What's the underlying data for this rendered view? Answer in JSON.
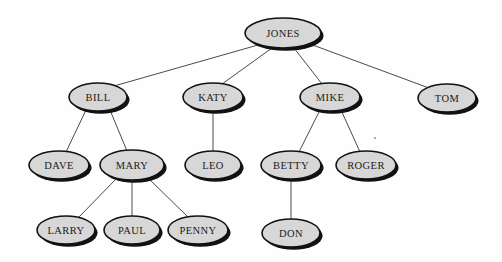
{
  "diagram": {
    "type": "tree",
    "background_color": "#fefefe",
    "node_fill_color": "#d7d7d7",
    "node_stroke_color": "#111111",
    "node_shadow_color": "#121212",
    "edge_color": "#4a4a4a",
    "label_color": "#1a1a1a",
    "root": "JONES",
    "nodes": [
      {
        "id": "JONES",
        "label": "JONES",
        "cx": 283,
        "cy": 33,
        "rx": 38,
        "ry": 15,
        "level": 0
      },
      {
        "id": "BILL",
        "label": "BILL",
        "cx": 98,
        "cy": 97,
        "rx": 29,
        "ry": 14,
        "level": 1
      },
      {
        "id": "KATY",
        "label": "KATY",
        "cx": 213,
        "cy": 97,
        "rx": 30,
        "ry": 14,
        "level": 1
      },
      {
        "id": "MIKE",
        "label": "MIKE",
        "cx": 330,
        "cy": 97,
        "rx": 30,
        "ry": 14,
        "level": 1
      },
      {
        "id": "TOM",
        "label": "TOM",
        "cx": 447,
        "cy": 98,
        "rx": 29,
        "ry": 14,
        "level": 1
      },
      {
        "id": "DAVE",
        "label": "DAVE",
        "cx": 59,
        "cy": 165,
        "rx": 30,
        "ry": 14,
        "level": 2
      },
      {
        "id": "MARY",
        "label": "MARY",
        "cx": 132,
        "cy": 165,
        "rx": 32,
        "ry": 15,
        "level": 2
      },
      {
        "id": "LEO",
        "label": "LEO",
        "cx": 213,
        "cy": 165,
        "rx": 28,
        "ry": 14,
        "level": 2
      },
      {
        "id": "BETTY",
        "label": "BETTY",
        "cx": 291,
        "cy": 165,
        "rx": 30,
        "ry": 14,
        "level": 2
      },
      {
        "id": "ROGER",
        "label": "ROGER",
        "cx": 366,
        "cy": 165,
        "rx": 30,
        "ry": 14,
        "level": 2
      },
      {
        "id": "LARRY",
        "label": "LARRY",
        "cx": 66,
        "cy": 230,
        "rx": 29,
        "ry": 14,
        "level": 3
      },
      {
        "id": "PAUL",
        "label": "PAUL",
        "cx": 132,
        "cy": 230,
        "rx": 28,
        "ry": 14,
        "level": 3
      },
      {
        "id": "PENNY",
        "label": "PENNY",
        "cx": 198,
        "cy": 230,
        "rx": 30,
        "ry": 14,
        "level": 3
      },
      {
        "id": "DON",
        "label": "DON",
        "cx": 291,
        "cy": 233,
        "rx": 29,
        "ry": 14,
        "level": 3
      }
    ],
    "edges": [
      {
        "from": "JONES",
        "to": "BILL",
        "x1": 258,
        "y1": 45,
        "x2": 114,
        "y2": 86
      },
      {
        "from": "JONES",
        "to": "KATY",
        "x1": 272,
        "y1": 48,
        "x2": 222,
        "y2": 84
      },
      {
        "from": "JONES",
        "to": "MIKE",
        "x1": 294,
        "y1": 48,
        "x2": 322,
        "y2": 84
      },
      {
        "from": "JONES",
        "to": "TOM",
        "x1": 310,
        "y1": 44,
        "x2": 429,
        "y2": 88
      },
      {
        "from": "BILL",
        "to": "DAVE",
        "x1": 86,
        "y1": 110,
        "x2": 66,
        "y2": 152
      },
      {
        "from": "BILL",
        "to": "MARY",
        "x1": 110,
        "y1": 110,
        "x2": 127,
        "y2": 151
      },
      {
        "from": "KATY",
        "to": "LEO",
        "x1": 213,
        "y1": 111,
        "x2": 213,
        "y2": 152
      },
      {
        "from": "MIKE",
        "to": "BETTY",
        "x1": 320,
        "y1": 110,
        "x2": 299,
        "y2": 152
      },
      {
        "from": "MIKE",
        "to": "ROGER",
        "x1": 341,
        "y1": 110,
        "x2": 360,
        "y2": 152
      },
      {
        "from": "MARY",
        "to": "LARRY",
        "x1": 117,
        "y1": 178,
        "x2": 79,
        "y2": 217
      },
      {
        "from": "MARY",
        "to": "PAUL",
        "x1": 132,
        "y1": 180,
        "x2": 132,
        "y2": 217
      },
      {
        "from": "MARY",
        "to": "PENNY",
        "x1": 148,
        "y1": 178,
        "x2": 188,
        "y2": 217
      },
      {
        "from": "BETTY",
        "to": "DON",
        "x1": 291,
        "y1": 179,
        "x2": 291,
        "y2": 220
      }
    ],
    "artifacts": [
      {
        "name": "speck",
        "cx": 375,
        "cy": 138,
        "r": 1.1
      }
    ]
  }
}
